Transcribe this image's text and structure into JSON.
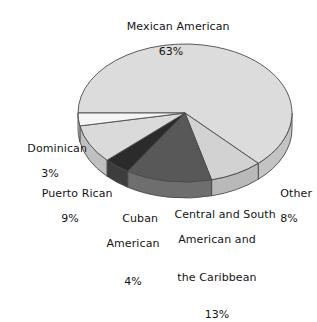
{
  "chart_data": {
    "type": "pie",
    "title": "",
    "subtitle": "",
    "xlabel": "",
    "ylabel": "",
    "legend_position": "none",
    "grid": false,
    "three_d": true,
    "units": "%",
    "total": 100,
    "categories": [
      "Mexican American",
      "Other",
      "Central and South American and the Caribbean",
      "Cuban American",
      "Puerto Rican",
      "Dominican"
    ],
    "values": [
      63,
      8,
      13,
      4,
      9,
      3
    ],
    "slices": [
      {
        "name": "mexican-american",
        "label": "Mexican American",
        "label_lines": [
          "Mexican American"
        ],
        "value": 63,
        "value_text": "63%",
        "color": "#dcdcdc",
        "side_color": "#c3c3c3"
      },
      {
        "name": "other",
        "label": "Other",
        "label_lines": [
          "Other"
        ],
        "value": 8,
        "value_text": "8%",
        "color": "#d2d2d2",
        "side_color": "#b9b9b9"
      },
      {
        "name": "central-and-south-american-and-the-caribbean",
        "label": "Central and South American and the Caribbean",
        "label_lines": [
          "Central and South",
          "American and",
          "the Caribbean"
        ],
        "value": 13,
        "value_text": "13%",
        "color": "#585858",
        "side_color": "#6e6e6e"
      },
      {
        "name": "cuban-american",
        "label": "Cuban American",
        "label_lines": [
          "Cuban",
          "American"
        ],
        "value": 4,
        "value_text": "4%",
        "color": "#2b2b2b",
        "side_color": "#3d3d3d"
      },
      {
        "name": "puerto-rican",
        "label": "Puerto Rican",
        "label_lines": [
          "Puerto Rican"
        ],
        "value": 9,
        "value_text": "9%",
        "color": "#dadada",
        "side_color": "#c0c0c0"
      },
      {
        "name": "dominican",
        "label": "Dominican",
        "label_lines": [
          "Dominican"
        ],
        "value": 3,
        "value_text": "3%",
        "color": "#f6f6f6",
        "side_color": "#dadada"
      }
    ],
    "colors": {
      "background": "#ffffff",
      "outline": "#4a4a4a",
      "text": "#141414"
    }
  },
  "labels": {
    "mexican": {
      "line1": "Mexican American",
      "pct": "63%"
    },
    "dominican": {
      "line1": "Dominican",
      "pct": "3%"
    },
    "puertorican": {
      "line1": "Puerto Rican",
      "pct": "9%"
    },
    "cuban": {
      "line1": "Cuban",
      "line2": "American",
      "pct": "4%"
    },
    "central": {
      "line1": "Central and South",
      "line2": "American and",
      "line3": "the Caribbean",
      "pct": "13%"
    },
    "other": {
      "line1": "Other",
      "pct": "8%"
    }
  }
}
